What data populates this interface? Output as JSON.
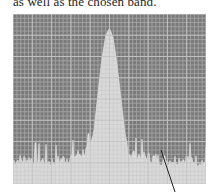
{
  "caption": {
    "text": "as well as the chosen band."
  },
  "figure": {
    "kind": "spectrum-analyzer-display",
    "colors": {
      "screen_background": "#7a7a7a",
      "grid_minor": "#9a9a9a",
      "grid_major": "#c4c4c4",
      "trace_fill": "#d9d9d9",
      "callout_line": "#222222"
    },
    "grid": {
      "major_cols": 10,
      "major_rows": 8,
      "minor_per_major": 5
    }
  },
  "chart_data": {
    "type": "area",
    "title": "",
    "xlabel": "",
    "ylabel": "",
    "x": [
      0,
      10,
      20,
      30,
      40,
      42,
      44,
      46,
      48,
      50,
      52,
      54,
      56,
      58,
      60,
      70,
      80,
      90,
      100
    ],
    "values": [
      15,
      16,
      14,
      17,
      22,
      35,
      58,
      80,
      95,
      100,
      93,
      76,
      54,
      33,
      20,
      17,
      15,
      16,
      14
    ],
    "xlim": [
      0,
      100
    ],
    "ylim": [
      0,
      100
    ],
    "grid": true,
    "legend": "none",
    "annotations": [
      {
        "type": "callout-line",
        "target": "noise floor, right of peak"
      }
    ]
  }
}
